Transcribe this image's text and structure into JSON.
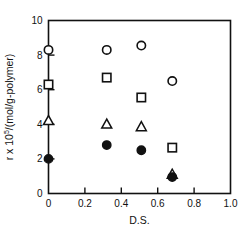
{
  "chart_data": {
    "type": "scatter",
    "title": "",
    "xlabel": "D.S.",
    "ylabel": "r x 10^5/(mol/g-polymer)",
    "ylabel_parts": {
      "lead": "r x 10",
      "exponent": "5",
      "tail": "/(mol/g-polymer)"
    },
    "xlim": [
      0.0,
      1.0
    ],
    "ylim": [
      0.0,
      10.0
    ],
    "xticks": [
      0.0,
      0.2,
      0.4,
      0.6,
      0.8,
      1.0
    ],
    "xtick_labels": [
      "0",
      "0.2",
      "0.4",
      "0.6",
      "0.8",
      "1.0"
    ],
    "yticks": [
      0,
      2,
      4,
      6,
      8,
      10
    ],
    "ytick_labels": [
      "0",
      "2",
      "4",
      "6",
      "8",
      "10"
    ],
    "grid": false,
    "legend": "none",
    "tick_direction": "in",
    "frame": "box",
    "series": [
      {
        "name": "open-circle",
        "marker": "circle-open",
        "x": [
          0.0,
          0.32,
          0.51,
          0.68
        ],
        "y": [
          8.3,
          8.3,
          8.55,
          6.5
        ]
      },
      {
        "name": "open-square",
        "marker": "square-open",
        "x": [
          0.0,
          0.32,
          0.51,
          0.68
        ],
        "y": [
          6.3,
          6.7,
          5.55,
          2.65
        ]
      },
      {
        "name": "open-triangle",
        "marker": "triangle-open",
        "x": [
          0.0,
          0.32,
          0.51,
          0.68
        ],
        "y": [
          4.2,
          4.0,
          3.85,
          1.1
        ]
      },
      {
        "name": "filled-circle",
        "marker": "circle-filled",
        "x": [
          0.0,
          0.32,
          0.51,
          0.68
        ],
        "y": [
          2.0,
          2.8,
          2.5,
          0.95
        ]
      }
    ]
  }
}
